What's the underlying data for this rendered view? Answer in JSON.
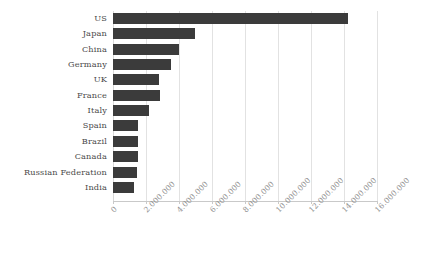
{
  "chart_data": {
    "type": "bar",
    "orientation": "horizontal",
    "title": "",
    "subtitle": "",
    "xlabel": "",
    "ylabel": "",
    "categories": [
      "US",
      "Japan",
      "China",
      "Germany",
      "UK",
      "France",
      "Italy",
      "Spain",
      "Brazil",
      "Canada",
      "Russian Federation",
      "India"
    ],
    "values": [
      14260000,
      4990000,
      4020000,
      3530000,
      2810000,
      2870000,
      2200000,
      1530000,
      1530000,
      1530000,
      1470000,
      1290000
    ],
    "value_labels": [
      "14.260.000",
      "4.990.000",
      "4.020.000",
      "3.530.000",
      "2.810.000",
      "2.870.000",
      "2.200.000",
      "1.530.000",
      "1.530.000",
      "1.530.000",
      "1.470.000",
      "1.290.000"
    ],
    "xlim": [
      0,
      16000000
    ],
    "xticks": [
      0,
      2000000,
      4000000,
      6000000,
      8000000,
      10000000,
      12000000,
      14000000,
      16000000
    ],
    "xtick_labels": [
      "0",
      "2.000.000",
      "4.000.000",
      "6.000.000",
      "8.000.000",
      "10.000.000",
      "12.000.000",
      "14.000.000",
      "16.000.000"
    ],
    "grid": true,
    "grid_axis": "x",
    "legend": false,
    "legend_position": "none",
    "series": [
      {
        "name": "",
        "values": [
          14260000,
          4990000,
          4020000,
          3530000,
          2810000,
          2870000,
          2200000,
          1530000,
          1530000,
          1530000,
          1470000,
          1290000
        ]
      }
    ]
  },
  "style": {
    "bar_color": "#3b3b3b",
    "grid_color": "#e2e2e2",
    "axis_color": "#c9c9c9",
    "category_label_color": "#4a4a4a",
    "tick_label_color": "#8e8e8e",
    "background": "#ffffff"
  }
}
